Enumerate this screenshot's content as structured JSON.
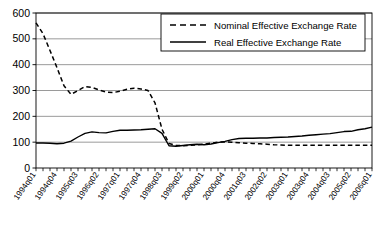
{
  "chart_data": {
    "type": "line",
    "title": "",
    "subtitle": "",
    "xlabel": "",
    "ylabel": "",
    "ylim": [
      0,
      600
    ],
    "ytick_values": [
      0,
      100,
      200,
      300,
      400,
      500,
      600
    ],
    "ytick_labels": [
      "0",
      "100",
      "200",
      "300",
      "400",
      "500",
      "600"
    ],
    "grid": "horizontal",
    "legend_position": "top-right",
    "x": [
      "1994q01",
      "1994q02",
      "1994q03",
      "1994q04",
      "1995q01",
      "1995q02",
      "1995q03",
      "1995q04",
      "1996q01",
      "1996q02",
      "1996q03",
      "1996q04",
      "1997q01",
      "1997q02",
      "1997q03",
      "1997q04",
      "1998q01",
      "1998q02",
      "1998q03",
      "1998q04",
      "1999q01",
      "1999q02",
      "1999q03",
      "1999q04",
      "2000q01",
      "2000q02",
      "2000q03",
      "2000q04",
      "2001q01",
      "2001q02",
      "2001q03",
      "2001q04",
      "2002q01",
      "2002q02",
      "2002q03",
      "2002q04",
      "2003q01",
      "2003q02",
      "2003q03",
      "2003q04",
      "2004q01",
      "2004q02",
      "2004q03",
      "2004q04",
      "2005q01",
      "2005q02",
      "2005q03",
      "2005q04",
      "2006q01"
    ],
    "xtick_labels": [
      "1994q01",
      "1994q04",
      "1995q03",
      "1996q02",
      "1997q01",
      "1997q04",
      "1998q03",
      "1999q02",
      "2000q01",
      "2000q04",
      "2001q03",
      "2002q02",
      "2003q01",
      "2003q04",
      "2004q03",
      "2005q02",
      "2006q01"
    ],
    "xtick_label_indices": [
      0,
      3,
      6,
      9,
      12,
      15,
      18,
      21,
      24,
      27,
      30,
      33,
      36,
      39,
      42,
      45,
      48
    ],
    "series": [
      {
        "name": "Nominal Effective Exchange Rate",
        "style": "dashed",
        "color": "#000000",
        "values": [
          562,
          520,
          455,
          388,
          318,
          285,
          300,
          315,
          312,
          302,
          294,
          292,
          297,
          305,
          309,
          306,
          300,
          252,
          150,
          95,
          88,
          86,
          88,
          90,
          92,
          96,
          100,
          101,
          100,
          98,
          96,
          95,
          94,
          92,
          90,
          89,
          88,
          88,
          88,
          88,
          88,
          88,
          88,
          88,
          88,
          88,
          88,
          88,
          88
        ]
      },
      {
        "name": "Real Effective Exchange Rate",
        "style": "solid",
        "color": "#000000",
        "values": [
          97,
          97,
          96,
          94,
          96,
          104,
          120,
          134,
          140,
          137,
          136,
          142,
          146,
          146,
          147,
          148,
          150,
          152,
          134,
          86,
          84,
          87,
          90,
          92,
          90,
          93,
          98,
          103,
          110,
          114,
          115,
          115,
          116,
          116,
          118,
          119,
          120,
          122,
          124,
          127,
          129,
          131,
          133,
          137,
          141,
          142,
          148,
          152,
          158
        ]
      }
    ]
  },
  "legend": {
    "entries": [
      {
        "label": "Nominal Effective Exchange Rate",
        "style": "dashed"
      },
      {
        "label": "Real Effective Exchange Rate",
        "style": "solid"
      }
    ]
  },
  "colors": {
    "axis": "#000000",
    "grid": "#808080",
    "plot_background": "#ffffff",
    "legend_border": "#000000"
  }
}
